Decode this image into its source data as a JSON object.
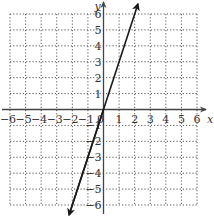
{
  "chart_data": {
    "type": "line",
    "title": "",
    "xlabel": "x",
    "ylabel": "y",
    "xlim": [
      -6,
      6
    ],
    "ylim": [
      -6,
      6
    ],
    "grid": true,
    "grid_style": "dotted",
    "x_ticks": [
      -6,
      -5,
      -4,
      -3,
      -2,
      -1,
      0,
      1,
      2,
      3,
      4,
      5,
      6
    ],
    "y_ticks": [
      -6,
      -5,
      -4,
      -3,
      -2,
      -1,
      1,
      2,
      3,
      4,
      5,
      6
    ],
    "x_tick_labels": [
      "−6",
      "−5",
      "−4",
      "−3",
      "−2",
      "−1",
      "0",
      "1",
      "2",
      "3",
      "4",
      "5",
      "6"
    ],
    "y_tick_labels": [
      "−6",
      "−5",
      "−4",
      "−3",
      "−2",
      "−1",
      "1",
      "2",
      "3",
      "4",
      "5",
      "6"
    ],
    "series": [
      {
        "name": "y = 3x",
        "equation": "y = 3x",
        "slope": 3,
        "intercept": 0,
        "x": [
          -2.2,
          -2,
          -1,
          0,
          1,
          2,
          2.2
        ],
        "y": [
          -6.6,
          -6,
          -3,
          0,
          3,
          6,
          6.6
        ],
        "arrows_both_ends": true
      }
    ]
  },
  "colors": {
    "axis": "#444444",
    "grid": "#555555",
    "line": "#1a1a1a",
    "text": "#333333"
  }
}
